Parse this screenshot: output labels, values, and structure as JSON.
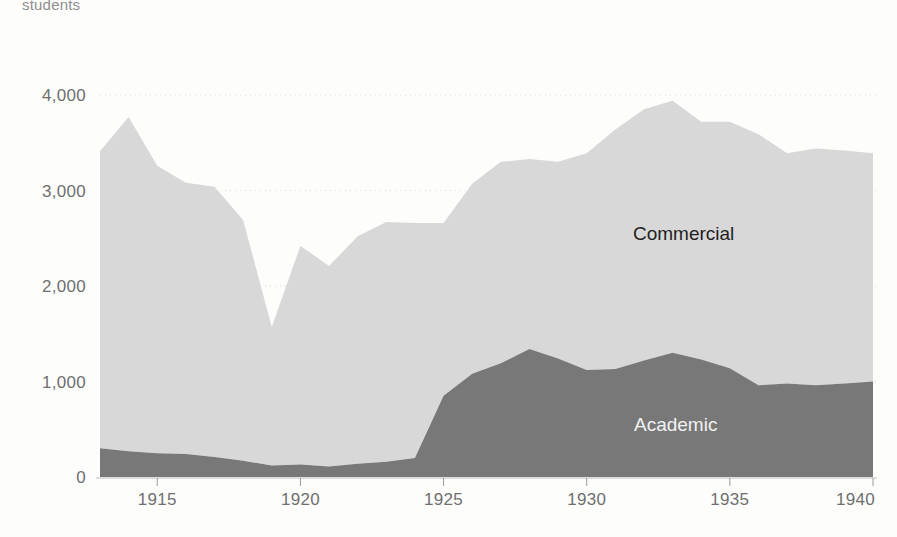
{
  "axis_unit_label": "students",
  "colors": {
    "commercial_fill": "#d8d8d8",
    "academic_fill": "#787878",
    "axis_text": "#6f6f6f",
    "gridline": "#cfcfcf",
    "background": "#fdfdfc",
    "commercial_label_text": "#1f1f1f",
    "academic_label_text": "#f2f2f2"
  },
  "series_labels": {
    "commercial": "Commercial",
    "academic": "Academic"
  },
  "chart_data": {
    "type": "area",
    "stacked": true,
    "title": "",
    "subtitle": "",
    "xlabel": "",
    "ylabel": "students",
    "ylim": [
      0,
      4200
    ],
    "xlim": [
      1913,
      1940
    ],
    "grid": true,
    "legend_position": "inline-on-areas",
    "y_ticks": [
      0,
      1000,
      2000,
      3000,
      4000
    ],
    "y_tick_labels": [
      "0",
      "1,000",
      "2,000",
      "3,000",
      "4,000"
    ],
    "x_ticks": [
      1915,
      1920,
      1925,
      1930,
      1935,
      1940
    ],
    "x_tick_labels": [
      "1915",
      "1920",
      "1925",
      "1930",
      "1935",
      "1940"
    ],
    "x": [
      1913,
      1914,
      1915,
      1916,
      1917,
      1918,
      1919,
      1920,
      1921,
      1922,
      1923,
      1924,
      1925,
      1926,
      1927,
      1928,
      1929,
      1930,
      1931,
      1932,
      1933,
      1934,
      1935,
      1936,
      1937,
      1938,
      1939,
      1940
    ],
    "series": [
      {
        "name": "Academic",
        "values": [
          300,
          270,
          250,
          240,
          210,
          170,
          120,
          130,
          110,
          140,
          160,
          200,
          850,
          1080,
          1190,
          1340,
          1240,
          1120,
          1130,
          1220,
          1300,
          1230,
          1140,
          960,
          980,
          960,
          980,
          1000
        ]
      },
      {
        "name": "Commercial",
        "values": [
          3110,
          3500,
          3010,
          2840,
          2830,
          2520,
          1450,
          2290,
          2100,
          2380,
          2510,
          2460,
          1810,
          1990,
          2110,
          1990,
          2060,
          2270,
          2510,
          2630,
          2640,
          2490,
          2580,
          2630,
          2410,
          2480,
          2440,
          2390
        ]
      }
    ],
    "totals": [
      3410,
      3770,
      3260,
      3080,
      3040,
      2690,
      1570,
      2420,
      2210,
      2520,
      2670,
      2660,
      2660,
      3070,
      3300,
      3330,
      3300,
      3390,
      3640,
      3850,
      3940,
      3720,
      3720,
      3590,
      3390,
      3440,
      3420,
      3390
    ]
  },
  "geometry": {
    "plot_left": 100,
    "plot_right": 873,
    "plot_top": 95,
    "plot_bottom": 477
  }
}
